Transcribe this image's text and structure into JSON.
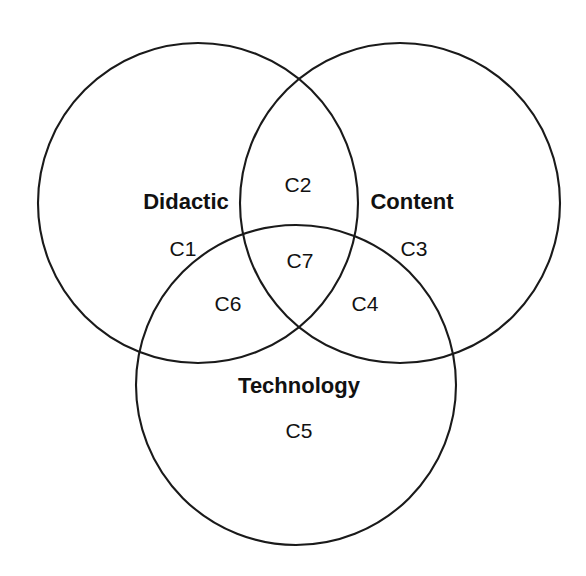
{
  "diagram": {
    "type": "venn",
    "set_count": 3,
    "background_color": "#ffffff",
    "stroke_color": "#1a1a1a",
    "text_color": "#111111",
    "sets": [
      {
        "id": "didactic",
        "title": "Didactic",
        "title_x": 186,
        "title_y": 203,
        "cx": 198,
        "cy": 203,
        "r": 160
      },
      {
        "id": "content",
        "title": "Content",
        "title_x": 412,
        "title_y": 203,
        "cx": 400,
        "cy": 203,
        "r": 160
      },
      {
        "id": "technology",
        "title": "Technology",
        "title_x": 299,
        "title_y": 387,
        "cx": 296,
        "cy": 385,
        "r": 160
      }
    ],
    "regions": [
      {
        "id": "c1",
        "label": "C1",
        "x": 183,
        "y": 250,
        "belongs_to": [
          "didactic"
        ]
      },
      {
        "id": "c2",
        "label": "C2",
        "x": 298,
        "y": 186,
        "belongs_to": [
          "didactic",
          "content"
        ]
      },
      {
        "id": "c3",
        "label": "C3",
        "x": 414,
        "y": 250,
        "belongs_to": [
          "content"
        ]
      },
      {
        "id": "c4",
        "label": "C4",
        "x": 365,
        "y": 305,
        "belongs_to": [
          "content",
          "technology"
        ]
      },
      {
        "id": "c5",
        "label": "C5",
        "x": 299,
        "y": 432,
        "belongs_to": [
          "technology"
        ]
      },
      {
        "id": "c6",
        "label": "C6",
        "x": 228,
        "y": 305,
        "belongs_to": [
          "didactic",
          "technology"
        ]
      },
      {
        "id": "c7",
        "label": "C7",
        "x": 300,
        "y": 262,
        "belongs_to": [
          "didactic",
          "content",
          "technology"
        ]
      }
    ]
  }
}
